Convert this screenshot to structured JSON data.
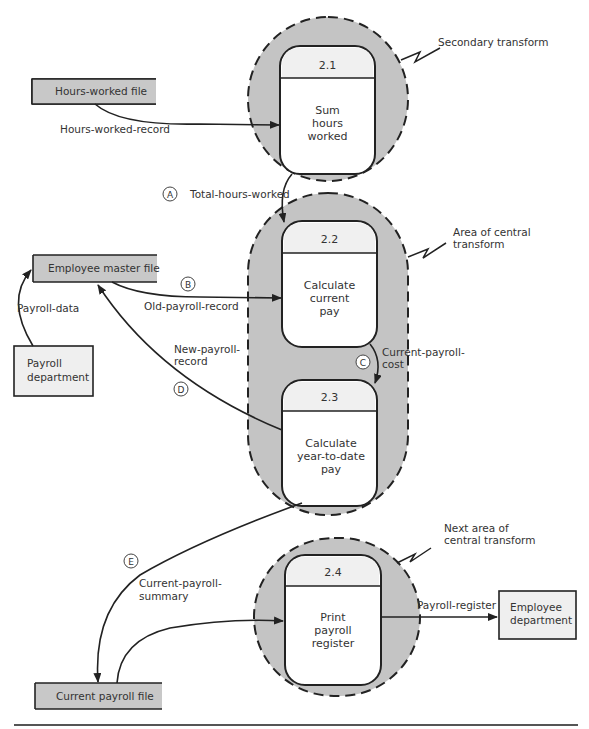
{
  "diagram": {
    "type": "data-flow-diagram",
    "processes": [
      {
        "id": "2.1",
        "name_lines": [
          "Sum",
          "hours",
          "worked"
        ]
      },
      {
        "id": "2.2",
        "name_lines": [
          "Calculate",
          "current",
          "pay"
        ]
      },
      {
        "id": "2.3",
        "name_lines": [
          "Calculate",
          "year-to-date",
          "pay"
        ]
      },
      {
        "id": "2.4",
        "name_lines": [
          "Print",
          "payroll",
          "register"
        ]
      }
    ],
    "data_stores": [
      {
        "label": "Hours-worked file"
      },
      {
        "label": "Employee master file"
      },
      {
        "label": "Current payroll file"
      }
    ],
    "external_entities": [
      {
        "label_lines": [
          "Payroll",
          "department"
        ]
      },
      {
        "label_lines": [
          "Employee",
          "department"
        ]
      }
    ],
    "flows": [
      {
        "label_lines": [
          "Hours-worked-record"
        ],
        "marker": ""
      },
      {
        "label_lines": [
          "Total-hours-worked"
        ],
        "marker": "A"
      },
      {
        "label_lines": [
          "Old-payroll-record"
        ],
        "marker": "B"
      },
      {
        "label_lines": [
          "Current-payroll-",
          "cost"
        ],
        "marker": "C"
      },
      {
        "label_lines": [
          "New-payroll-",
          "record"
        ],
        "marker": "D"
      },
      {
        "label_lines": [
          "Current-payroll-",
          "summary"
        ],
        "marker": "E"
      },
      {
        "label_lines": [
          "Payroll-data"
        ],
        "marker": ""
      },
      {
        "label_lines": [
          "Payroll-register"
        ],
        "marker": ""
      }
    ],
    "annotations": [
      {
        "lines": [
          "Secondary transform"
        ]
      },
      {
        "lines": [
          "Area of central",
          "transform"
        ]
      },
      {
        "lines": [
          "Next area of",
          "central transform"
        ]
      }
    ]
  }
}
